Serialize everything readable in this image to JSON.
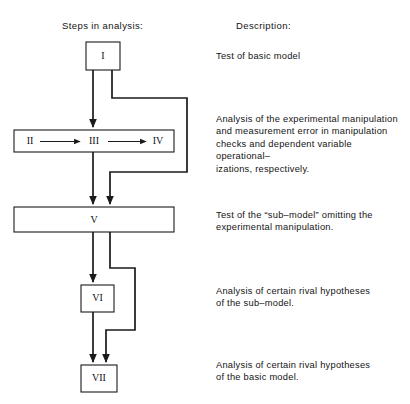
{
  "headers": {
    "steps": "Steps in analysis:",
    "description": "Description:"
  },
  "nodes": [
    {
      "id": "I",
      "label": "I"
    },
    {
      "id": "II",
      "label": "II"
    },
    {
      "id": "III",
      "label": "III"
    },
    {
      "id": "IV",
      "label": "IV"
    },
    {
      "id": "V",
      "label": "V"
    },
    {
      "id": "VI",
      "label": "VI"
    },
    {
      "id": "VII",
      "label": "VII"
    }
  ],
  "descriptions": [
    {
      "for": "I",
      "text": "Test of basic model"
    },
    {
      "for": "II-III-IV",
      "text": "Analysis of the experimental manipulation\nand measurement error in manipulation\nchecks and dependent variable operational–\nizations, respectively."
    },
    {
      "for": "V",
      "text": "Test of the “sub–model” omitting the\nexperimental manipulation."
    },
    {
      "for": "VI",
      "text": "Analysis of certain rival hypotheses\nof the sub–model."
    },
    {
      "for": "VII",
      "text": "Analysis of certain rival hypotheses\nof the basic model."
    }
  ],
  "colors": {
    "background": "#ffffff",
    "stroke": "#1a1a1a",
    "text": "#141414"
  }
}
